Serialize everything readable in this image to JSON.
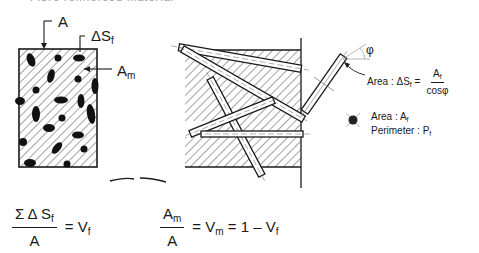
{
  "caption": {
    "text": "Fibre reinforced material"
  },
  "left_section": {
    "label_total_area": "A",
    "label_fiber_area_symbol": "ΔS",
    "label_fiber_area_sub": "f",
    "label_matrix_area": "A",
    "label_matrix_area_sub": "m"
  },
  "single_fiber": {
    "angle_symbol": "φ",
    "area_label": "Area : ΔS",
    "area_label_sub": "f",
    "area_eq": "=",
    "area_num": "A",
    "area_num_sub": "f",
    "area_den": "cosφ",
    "cross_section_area": "Area : A",
    "cross_section_area_sub": "f",
    "perimeter": "Perimeter : P",
    "perimeter_sub": "f"
  },
  "equations": {
    "vf": {
      "numerator": "Σ Δ S",
      "numerator_sub": "f",
      "denominator": "A",
      "rhs": "= V",
      "rhs_sub": "f"
    },
    "vm": {
      "numerator": "A",
      "numerator_sub": "m",
      "denominator": "A",
      "rhs_a": "= V",
      "rhs_a_sub": "m",
      "rhs_b": "= 1 – V",
      "rhs_b_sub": "f"
    }
  }
}
